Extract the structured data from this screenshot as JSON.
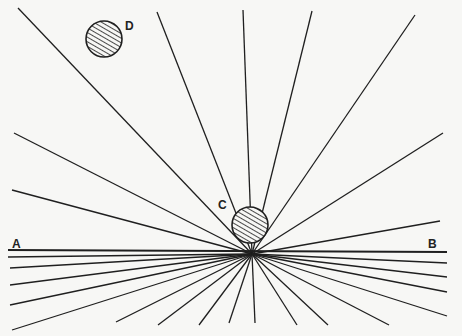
{
  "diagram": {
    "labels": {
      "A": "A",
      "B": "B",
      "C": "C",
      "D": "D"
    },
    "hub": [
      252,
      254
    ],
    "baseline": {
      "x1": 8,
      "y1": 250,
      "x2": 447,
      "y2": 252
    },
    "rays": [
      [
        18,
        8
      ],
      [
        157,
        12
      ],
      [
        243,
        10
      ],
      [
        312,
        11
      ],
      [
        415,
        15
      ],
      [
        440,
        221
      ],
      [
        443,
        133
      ],
      [
        14,
        133
      ],
      [
        12,
        190
      ],
      [
        8,
        257
      ],
      [
        10,
        268
      ],
      [
        10,
        285
      ],
      [
        10,
        305
      ],
      [
        12,
        330
      ],
      [
        116,
        322
      ],
      [
        158,
        325
      ],
      [
        199,
        325
      ],
      [
        229,
        323
      ],
      [
        255,
        323
      ],
      [
        297,
        325
      ],
      [
        328,
        325
      ],
      [
        389,
        325
      ],
      [
        447,
        263
      ],
      [
        447,
        277
      ],
      [
        447,
        292
      ],
      [
        447,
        316
      ]
    ],
    "circle_c": {
      "cx": 250,
      "cy": 225,
      "r": 18
    },
    "circle_d": {
      "cx": 104,
      "cy": 39,
      "r": 18
    },
    "colors": {
      "line": "#1f1f1f",
      "background": "#f7f7f5"
    }
  }
}
